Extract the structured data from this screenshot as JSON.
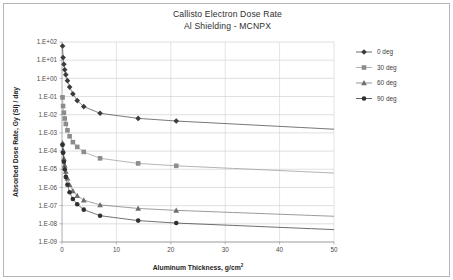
{
  "chart_data": {
    "type": "line",
    "title": "Callisto Electron Dose Rate",
    "subtitle": "Al Shielding - MCNPX",
    "xlabel": "Aluminum Thickness, g/cm",
    "xlabel_sup": "2",
    "ylabel": "Absorbed Dose Rate, Gy (Si) / day",
    "xlim": [
      0,
      50
    ],
    "ylim": [
      1e-09,
      100
    ],
    "yscale": "log",
    "xticks": [
      0,
      10,
      20,
      30,
      40,
      50
    ],
    "xtick_labels": [
      "0",
      "10",
      "20",
      "30",
      "40",
      "50"
    ],
    "yticks": [
      100,
      10,
      1,
      0.1,
      0.01,
      0.001,
      0.0001,
      1e-05,
      1e-06,
      1e-07,
      1e-08,
      1e-09
    ],
    "ytick_labels": [
      "1.E+02",
      "1.E+01",
      "1.E+00",
      "1.E-01",
      "1.E-02",
      "1.E-03",
      "1.E-04",
      "1.E-05",
      "1.E-06",
      "1.E-07",
      "1.E-08",
      "1.E-09"
    ],
    "grid": {
      "horizontal": true,
      "vertical": true
    },
    "legend_position": "right",
    "series": [
      {
        "name": "0 deg",
        "marker": "diamond",
        "color": "#3b3b3b",
        "line_color": "#4a4a4a",
        "x": [
          0.1,
          0.2,
          0.35,
          0.5,
          0.7,
          1.0,
          1.4,
          2.0,
          2.8,
          4.0,
          7.0,
          14.0,
          21.0,
          50.0
        ],
        "y": [
          60,
          14,
          6.0,
          3.0,
          1.6,
          0.75,
          0.33,
          0.14,
          0.06,
          0.028,
          0.012,
          0.0063,
          0.0045,
          0.0016
        ]
      },
      {
        "name": "30 deg",
        "marker": "square",
        "color": "#8c8c8c",
        "line_color": "#9a9a9a",
        "x": [
          0.1,
          0.2,
          0.35,
          0.5,
          0.7,
          1.0,
          1.4,
          2.0,
          2.8,
          4.0,
          7.0,
          14.0,
          21.0,
          50.0
        ],
        "y": [
          0.09,
          0.03,
          0.013,
          0.0062,
          0.0031,
          0.0014,
          0.00065,
          0.00031,
          0.00017,
          9e-05,
          4e-05,
          2.1e-05,
          1.55e-05,
          6.2e-06
        ]
      },
      {
        "name": "60 deg",
        "marker": "triangle",
        "color": "#6e6e6e",
        "line_color": "#7a7a7a",
        "x": [
          0.1,
          0.2,
          0.35,
          0.5,
          0.7,
          1.0,
          1.4,
          2.0,
          2.8,
          4.0,
          7.0,
          14.0,
          21.0,
          50.0
        ],
        "y": [
          0.00028,
          0.00011,
          4e-05,
          1.7e-05,
          7.5e-06,
          3.2e-06,
          1.4e-06,
          6.5e-07,
          3.5e-07,
          2e-07,
          1.1e-07,
          7e-08,
          5.5e-08,
          2.6e-08
        ]
      },
      {
        "name": "90 deg",
        "marker": "circle",
        "color": "#2f2f2f",
        "line_color": "#3d3d3d",
        "x": [
          0.1,
          0.2,
          0.35,
          0.5,
          0.7,
          1.0,
          1.4,
          2.0,
          2.8,
          4.0,
          7.0,
          14.0,
          21.0,
          50.0
        ],
        "y": [
          0.00022,
          8e-05,
          2.6e-05,
          1e-05,
          3.8e-06,
          1.4e-06,
          5.5e-07,
          2.3e-07,
          1.2e-07,
          6e-08,
          2.8e-08,
          1.5e-08,
          1.1e-08,
          4.8e-09
        ]
      }
    ]
  },
  "legend": {
    "items": [
      {
        "label": "0 deg"
      },
      {
        "label": "30 deg"
      },
      {
        "label": "60 deg"
      },
      {
        "label": "90 deg"
      }
    ]
  }
}
